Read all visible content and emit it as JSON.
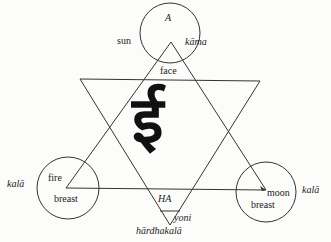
{
  "diagram": {
    "top_circle": {
      "inner": "A",
      "left": "sun",
      "right": "kāma",
      "below": "face"
    },
    "left_circle": {
      "inner_top": "fire",
      "inner_bottom": "breast",
      "outer": "kalā"
    },
    "right_circle": {
      "inner_top": "moon",
      "inner_bottom": "breast",
      "outer": "kalā"
    },
    "bottom": {
      "base": "HA",
      "point": "yoni",
      "caption": "hārdhakalā"
    },
    "center_glyph": "ई"
  }
}
